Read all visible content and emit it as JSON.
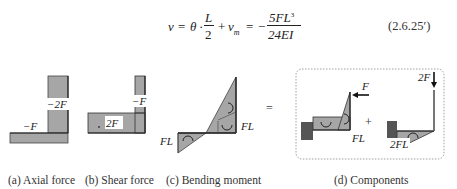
{
  "equation": {
    "lhs": "v",
    "theta": "θ",
    "frac1_num": "L",
    "frac1_den": "2",
    "vm": "v",
    "vm_sub": "m",
    "rhs_sign": "−",
    "frac2_num": "5FL",
    "frac2_num_exp": "3",
    "frac2_den": "24EI",
    "number": "(2.6.25′)"
  },
  "panels": {
    "axial": {
      "caption": "(a) Axial force",
      "labels": {
        "vertical": "−2F",
        "horizontal": "−F"
      }
    },
    "shear": {
      "caption": "(b) Shear force",
      "labels": {
        "vertical": "−F",
        "horizontal": "2F"
      }
    },
    "bending": {
      "caption": "(c) Bending moment",
      "labels": {
        "corner": "FL",
        "end": "FL"
      }
    },
    "equals": "=",
    "components": {
      "caption": "(d) Components",
      "plus": "+",
      "left": {
        "force": "F",
        "moment": "FL"
      },
      "right": {
        "force": "2F",
        "moment": "2FL"
      }
    }
  },
  "colors": {
    "fill": "#a6a6a6",
    "dark_fill": "#555555",
    "stroke": "#333333",
    "dashed_border": "#888888"
  }
}
